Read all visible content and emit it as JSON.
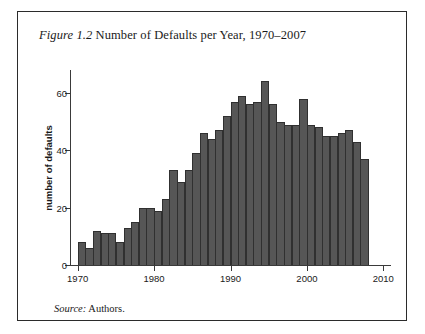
{
  "figure": {
    "label": "Figure 1.2",
    "caption": "Number of Defaults per Year, 1970–2007",
    "source_label": "Source:",
    "source_value": "Authors."
  },
  "style": {
    "bar_color": "#565656",
    "bar_edge_color": "#303030",
    "axis_color": "#3a3a3a",
    "frame_color": "#2b2b2b",
    "text_color": "#1a1a1a",
    "background": "#ffffff"
  },
  "chart_data": {
    "type": "bar",
    "title": "Figure 1.2 Number of Defaults per Year, 1970–2007",
    "xlabel": "",
    "ylabel": "number of defaults",
    "xlim": [
      1969,
      2011
    ],
    "ylim": [
      0,
      68
    ],
    "grid": false,
    "legend": false,
    "xticks": [
      1970,
      1980,
      1990,
      2000,
      2010
    ],
    "xtick_labels": [
      "1970",
      "1980",
      "1990",
      "2000",
      "2010"
    ],
    "yticks": [
      0,
      20,
      40,
      60
    ],
    "ytick_labels": [
      "0",
      "20",
      "40",
      "60"
    ],
    "categories": [
      1970,
      1971,
      1972,
      1973,
      1974,
      1975,
      1976,
      1977,
      1978,
      1979,
      1980,
      1981,
      1982,
      1983,
      1984,
      1985,
      1986,
      1987,
      1988,
      1989,
      1990,
      1991,
      1992,
      1993,
      1994,
      1995,
      1996,
      1997,
      1998,
      1999,
      2000,
      2001,
      2002,
      2003,
      2004,
      2005,
      2006,
      2007
    ],
    "values": [
      8,
      6,
      12,
      11,
      11,
      8,
      13,
      15,
      20,
      20,
      19,
      23,
      33,
      29,
      33,
      39,
      46,
      44,
      47,
      52,
      57,
      59,
      56,
      57,
      64,
      56,
      50,
      49,
      49,
      58,
      49,
      48,
      45,
      45,
      46,
      47,
      43,
      37
    ],
    "annotations": []
  }
}
